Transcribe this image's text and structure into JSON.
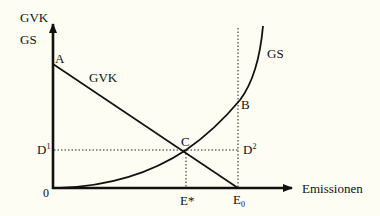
{
  "diagram": {
    "background": "#fdfdf3",
    "line_color": "#111111",
    "y_axis": {
      "label_line1": "GVK",
      "label_line2": "GS"
    },
    "x_axis": {
      "label": "Emissionen",
      "origin_label": "0"
    },
    "curves": {
      "gvk": {
        "label": "GVK",
        "description": "Grenzvermeidungskosten, falling line from A to E0"
      },
      "gs": {
        "label": "GS",
        "description": "Grenzschaden, rising convex curve from origin"
      }
    },
    "points": {
      "a": {
        "label": "A"
      },
      "b": {
        "label": "B"
      },
      "c": {
        "label": "C"
      },
      "d1": {
        "label": "D",
        "sup": "1"
      },
      "d2": {
        "label": "D",
        "sup": "2"
      },
      "e_star": {
        "label": "E*"
      },
      "e0": {
        "label": "E",
        "sub": "0"
      }
    }
  }
}
